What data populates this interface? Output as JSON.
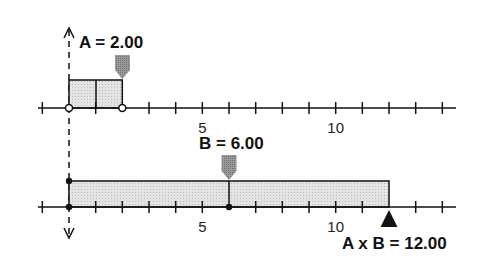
{
  "diagram": {
    "type": "number-line-multiplication",
    "unit_px": 26.67,
    "origin_x": 69,
    "colors": {
      "line": "#111111",
      "fill": "#d6d6d6",
      "marker": "#8a8a8a",
      "background": "#ffffff"
    },
    "top_line": {
      "label": "A = 2.00",
      "value": 2,
      "tick_labels": [
        {
          "value": 5,
          "text": "5"
        },
        {
          "value": 10,
          "text": "10"
        }
      ]
    },
    "bottom_line": {
      "label": "B = 6.00",
      "value": 6,
      "tick_labels": [
        {
          "value": 5,
          "text": "5"
        },
        {
          "value": 10,
          "text": "10"
        }
      ]
    },
    "result": {
      "label": "A x B = 12.00",
      "value": 12
    }
  }
}
